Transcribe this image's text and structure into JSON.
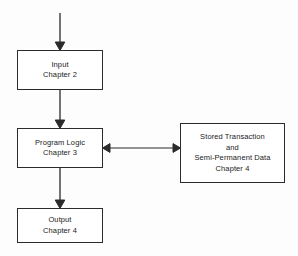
{
  "diagram": {
    "background_color": "#fdfdfd",
    "stroke_color": "#2b2b2b",
    "text_color": "#1a1a1a",
    "nodes": [
      {
        "id": "input",
        "name": "input-box",
        "lines": [
          "Input",
          "Chapter 2"
        ],
        "x": 17,
        "y": 50,
        "w": 86,
        "h": 40
      },
      {
        "id": "logic",
        "name": "program-logic-box",
        "lines": [
          "Program Logic",
          "Chapter 3"
        ],
        "x": 17,
        "y": 128,
        "w": 86,
        "h": 40
      },
      {
        "id": "output",
        "name": "output-box",
        "lines": [
          "Output",
          "Chapter 4"
        ],
        "x": 17,
        "y": 208,
        "w": 86,
        "h": 35
      },
      {
        "id": "stored",
        "name": "stored-transaction-box",
        "lines": [
          "Stored Transaction",
          "and",
          "Semi-Permanent Data",
          "Chapter 4"
        ],
        "x": 180,
        "y": 123,
        "w": 105,
        "h": 60
      }
    ],
    "connectors": [
      {
        "id": "entry-to-input",
        "name": "entry-arrow",
        "direction": "down",
        "from_x": 60,
        "from_y": 13,
        "to_x": 60,
        "to_y": 50
      },
      {
        "id": "input-to-logic",
        "name": "input-to-logic-arrow",
        "direction": "down",
        "from_x": 60,
        "from_y": 90,
        "to_x": 60,
        "to_y": 128
      },
      {
        "id": "logic-to-output",
        "name": "logic-to-output-arrow",
        "direction": "down",
        "from_x": 60,
        "from_y": 168,
        "to_x": 60,
        "to_y": 208
      },
      {
        "id": "logic-to-stored",
        "name": "logic-stored-bidirectional-arrow",
        "direction": "bidirectional-horizontal",
        "from_x": 103,
        "from_y": 148,
        "to_x": 180,
        "to_y": 148
      }
    ]
  }
}
